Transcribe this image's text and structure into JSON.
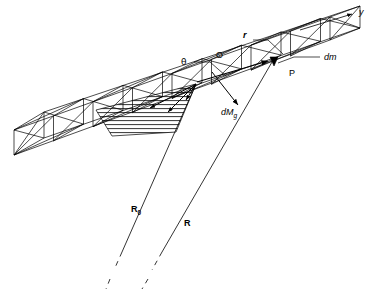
{
  "figure": {
    "background_color": "#ffffff",
    "line_color": "#000000",
    "width": 381,
    "height": 292
  },
  "labels": {
    "axis_y": "y",
    "angle_theta": "θ",
    "origin_O": "O",
    "vector_r": "r",
    "mass_element_dm": "dm",
    "point_P": "P",
    "torque_dMg": "dM",
    "torque_dMg_sub": "g",
    "vector_R0": "R",
    "vector_R0_sub": "0",
    "vector_R": "R"
  },
  "elements": {
    "truss": "wireframe-box-truss",
    "bays": 8,
    "hatch": "horizontal-line-fill",
    "dashed_tails": 2
  }
}
